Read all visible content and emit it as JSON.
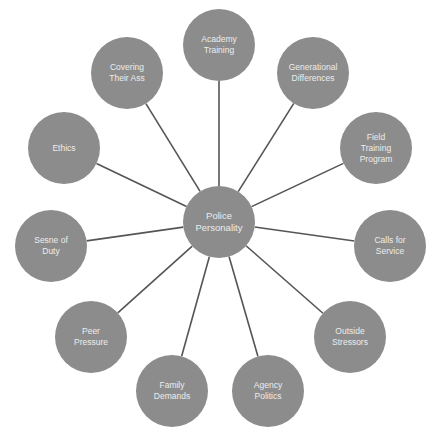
{
  "diagram": {
    "type": "radial-hub",
    "colors": {
      "node_fill": "#8c8c8c",
      "node_text": "#ececec",
      "connector": "#555555",
      "background": "#ffffff"
    },
    "center": {
      "label": "Police\nPersonality",
      "x": 219,
      "y": 222
    },
    "nodes": [
      {
        "id": "academy-training",
        "label": "Academy\nTraining",
        "x": 219,
        "y": 45
      },
      {
        "id": "generational-differences",
        "label": "Generational\nDifferences",
        "x": 313,
        "y": 73
      },
      {
        "id": "field-training-program",
        "label": "Field\nTraining\nProgram",
        "x": 376,
        "y": 148
      },
      {
        "id": "calls-for-service",
        "label": "Calls for\nService",
        "x": 390,
        "y": 246
      },
      {
        "id": "outside-stressors",
        "label": "Outside\nStressors",
        "x": 350,
        "y": 337
      },
      {
        "id": "agency-politics",
        "label": "Agency\nPolitics",
        "x": 268,
        "y": 391
      },
      {
        "id": "family-demands",
        "label": "Family\nDemands",
        "x": 172,
        "y": 391
      },
      {
        "id": "peer-pressure",
        "label": "Peer\nPressure",
        "x": 91,
        "y": 337
      },
      {
        "id": "sense-of-duty",
        "label": "Sesne of\nDuty",
        "x": 51,
        "y": 246
      },
      {
        "id": "ethics",
        "label": "Ethics",
        "x": 64,
        "y": 148
      },
      {
        "id": "covering-their-ass",
        "label": "Covering\nTheir Ass",
        "x": 127,
        "y": 73
      }
    ]
  }
}
